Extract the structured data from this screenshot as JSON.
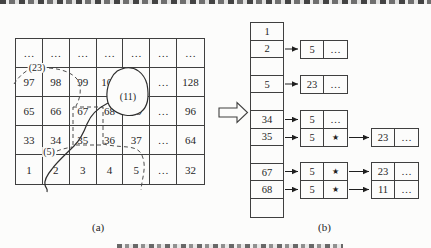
{
  "page": {
    "caption_a": "(a)",
    "caption_b": "(b)"
  },
  "grid": {
    "rows": [
      [
        "…",
        "…",
        "…",
        "…",
        "…",
        "…",
        "…"
      ],
      [
        "97",
        "98",
        "99",
        "100",
        "101",
        "…",
        "128"
      ],
      [
        "65",
        "66",
        "67",
        "68",
        "69",
        "…",
        "96"
      ],
      [
        "33",
        "34",
        "35",
        "36",
        "37",
        "…",
        "64"
      ],
      [
        "1",
        "2",
        "3",
        "4",
        "5",
        "…",
        "32"
      ]
    ],
    "labels": {
      "region23": "(23)",
      "region11": "(11)",
      "region5": "(5)"
    }
  },
  "array": {
    "cells": [
      "1",
      "2",
      "",
      "5",
      "",
      "34",
      "35",
      "",
      "67",
      "68",
      ""
    ]
  },
  "lists": {
    "rows": [
      {
        "from": "2",
        "level1": {
          "value": "5",
          "tail": "…"
        }
      },
      {
        "from": "5",
        "level1": {
          "value": "23",
          "tail": "…"
        }
      },
      {
        "from": "34",
        "level1": {
          "value": "5",
          "tail": "…"
        }
      },
      {
        "from": "35",
        "level1": {
          "value": "5",
          "tail": "★"
        },
        "level2": {
          "value": "23",
          "tail": "…"
        }
      },
      {
        "from": "67",
        "level1": {
          "value": "5",
          "tail": "★"
        },
        "level2": {
          "value": "23",
          "tail": "…"
        }
      },
      {
        "from": "68",
        "level1": {
          "value": "5",
          "tail": "★"
        },
        "level2": {
          "value": "11",
          "tail": "…"
        }
      }
    ]
  },
  "icons": {
    "transform_arrow": "hollow-right-arrow",
    "pointer_marker": "★",
    "ellipsis": "…"
  },
  "colors": {
    "ink": "#1f1f1f",
    "line": "#3f3f3f",
    "paper": "#fcfcfb"
  }
}
